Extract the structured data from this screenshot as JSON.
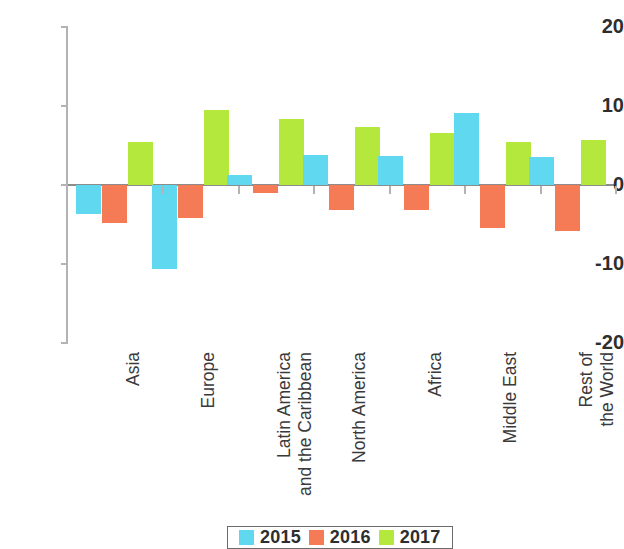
{
  "chart_data": {
    "type": "bar",
    "title": "",
    "subtitle": "",
    "xlabel": "",
    "ylabel": "",
    "ylim": [
      -20,
      20
    ],
    "yticks": [
      20,
      10,
      0,
      -10,
      -20
    ],
    "ytick_labels": [
      "20",
      "10",
      "0",
      "-10",
      "-20"
    ],
    "grid": false,
    "legend_position": "bottom",
    "categories": [
      "Asia",
      "Europe",
      "Latin America\nand the Caribbean",
      "North America",
      "Africa",
      "Middle East",
      "Rest of\nthe World"
    ],
    "series": [
      {
        "name": "2015",
        "color": "#5FD8F0",
        "values": [
          -3.7,
          -10.6,
          1.3,
          3.8,
          3.7,
          9.1,
          3.6
        ]
      },
      {
        "name": "2016",
        "color": "#F47B55",
        "values": [
          -4.8,
          -4.2,
          -1.0,
          -3.2,
          -3.2,
          -5.5,
          -5.8
        ]
      },
      {
        "name": "2017",
        "color": "#B5E83C",
        "values": [
          5.4,
          9.5,
          8.3,
          7.4,
          6.6,
          5.4,
          5.7
        ]
      }
    ]
  },
  "axis": {
    "zero_value": 0,
    "axis_color": "#b3b3b3",
    "zero_line_color": "#8c8c8c"
  },
  "legend": {
    "entries": [
      {
        "label": "2015",
        "color": "#5FD8F0"
      },
      {
        "label": "2016",
        "color": "#F47B55"
      },
      {
        "label": "2017",
        "color": "#B5E83C"
      }
    ]
  }
}
